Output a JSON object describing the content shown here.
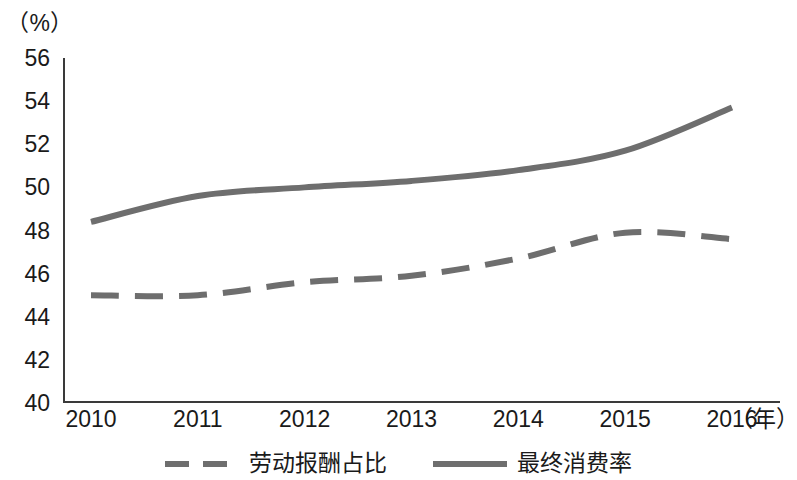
{
  "chart_data": {
    "type": "line",
    "title": "",
    "subtitle": "",
    "xlabel": "（年）",
    "ylabel": "（%）",
    "x": [
      2010,
      2011,
      2012,
      2013,
      2014,
      2015,
      2016
    ],
    "xtick_labels": [
      "2010",
      "2011",
      "2012",
      "2013",
      "2014",
      "2015",
      "2016"
    ],
    "ytick_labels": [
      "56",
      "54",
      "52",
      "50",
      "48",
      "46",
      "44",
      "42",
      "40"
    ],
    "ytick_values": [
      56,
      54,
      52,
      50,
      48,
      46,
      44,
      42,
      40
    ],
    "ylim": [
      40,
      56
    ],
    "xlim": [
      2010,
      2016
    ],
    "grid": false,
    "legend_position": "bottom",
    "series": [
      {
        "name": "劳动报酬占比",
        "style": "dashed",
        "color": "#6e6e6e",
        "values": [
          45.0,
          45.0,
          45.6,
          45.9,
          46.7,
          47.9,
          47.6
        ]
      },
      {
        "name": "最终消费率",
        "style": "solid",
        "color": "#6e6e6e",
        "values": [
          48.4,
          49.6,
          50.0,
          50.3,
          50.8,
          51.7,
          53.7
        ]
      }
    ]
  },
  "axes": {
    "y_unit_caption": "（%）",
    "x_unit_caption": "（年）"
  },
  "legend": {
    "items": [
      {
        "label": "劳动报酬占比",
        "style": "dashed",
        "color": "#6e6e6e"
      },
      {
        "label": "最终消费率",
        "style": "solid",
        "color": "#6e6e6e"
      }
    ]
  },
  "colors": {
    "axis": "#3a3a3a",
    "series_gray": "#6e6e6e",
    "background": "#ffffff",
    "text": "#1a1a1a"
  }
}
